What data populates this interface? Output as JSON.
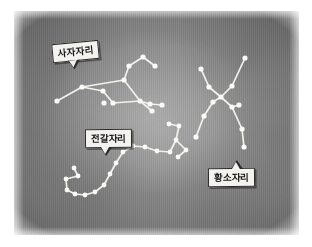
{
  "image": {
    "kind": "constellation-star-chart",
    "background_color": "#828282",
    "page_color": "#ffffff",
    "star_color": "#fbfaf6",
    "line_color": "#f2f1ec",
    "label_fill": "#f3f2ee",
    "label_border": "#2b2b2b",
    "label_text_color": "#151515"
  },
  "labels": [
    {
      "id": "leo",
      "text": "사자자리"
    },
    {
      "id": "scorpius",
      "text": "전갈자리"
    },
    {
      "id": "taurus",
      "text": "황소자리"
    }
  ],
  "constellations": [
    {
      "id": "leo",
      "name": "사자자리",
      "stars": [
        [
          57,
          101
        ],
        [
          82,
          87
        ],
        [
          103,
          91
        ],
        [
          104,
          103
        ],
        [
          140,
          101
        ],
        [
          150,
          104
        ],
        [
          162,
          105
        ],
        [
          152,
          111
        ],
        [
          129,
          66
        ],
        [
          143,
          57
        ],
        [
          155,
          66
        ],
        [
          124,
          80
        ],
        [
          113,
          103
        ]
      ],
      "edges": [
        [
          0,
          1
        ],
        [
          1,
          2
        ],
        [
          2,
          12
        ],
        [
          12,
          4
        ],
        [
          4,
          5
        ],
        [
          5,
          6
        ],
        [
          4,
          7
        ],
        [
          11,
          4
        ],
        [
          11,
          8
        ],
        [
          8,
          9
        ],
        [
          9,
          10
        ],
        [
          1,
          11
        ]
      ]
    },
    {
      "id": "scorpius",
      "name": "전갈자리",
      "stars": [
        [
          169,
          124
        ],
        [
          179,
          126
        ],
        [
          176,
          140
        ],
        [
          186,
          150
        ],
        [
          178,
          157
        ],
        [
          170,
          152
        ],
        [
          157,
          151
        ],
        [
          145,
          147
        ],
        [
          133,
          146
        ],
        [
          123,
          152
        ],
        [
          116,
          163
        ],
        [
          110,
          174
        ],
        [
          104,
          185
        ],
        [
          95,
          192
        ],
        [
          85,
          195
        ],
        [
          75,
          194
        ],
        [
          67,
          190
        ],
        [
          66,
          179
        ],
        [
          78,
          176
        ],
        [
          74,
          168
        ]
      ],
      "edges": [
        [
          0,
          1
        ],
        [
          1,
          2
        ],
        [
          2,
          3
        ],
        [
          3,
          4
        ],
        [
          2,
          5
        ],
        [
          5,
          6
        ],
        [
          6,
          7
        ],
        [
          7,
          8
        ],
        [
          8,
          9
        ],
        [
          9,
          10
        ],
        [
          10,
          11
        ],
        [
          11,
          12
        ],
        [
          12,
          13
        ],
        [
          13,
          14
        ],
        [
          14,
          15
        ],
        [
          15,
          16
        ],
        [
          16,
          17
        ],
        [
          17,
          18
        ],
        [
          18,
          19
        ]
      ]
    },
    {
      "id": "taurus",
      "name": "황소자리",
      "stars": [
        [
          201,
          69
        ],
        [
          209,
          87
        ],
        [
          221,
          97
        ],
        [
          213,
          102
        ],
        [
          204,
          116
        ],
        [
          196,
          137
        ],
        [
          232,
          107
        ],
        [
          239,
          105
        ],
        [
          232,
          86
        ],
        [
          245,
          58
        ],
        [
          242,
          129
        ],
        [
          244,
          147
        ]
      ],
      "edges": [
        [
          0,
          1
        ],
        [
          1,
          2
        ],
        [
          2,
          3
        ],
        [
          3,
          4
        ],
        [
          4,
          5
        ],
        [
          2,
          6
        ],
        [
          6,
          7
        ],
        [
          2,
          8
        ],
        [
          8,
          9
        ],
        [
          6,
          10
        ],
        [
          10,
          11
        ]
      ]
    }
  ]
}
